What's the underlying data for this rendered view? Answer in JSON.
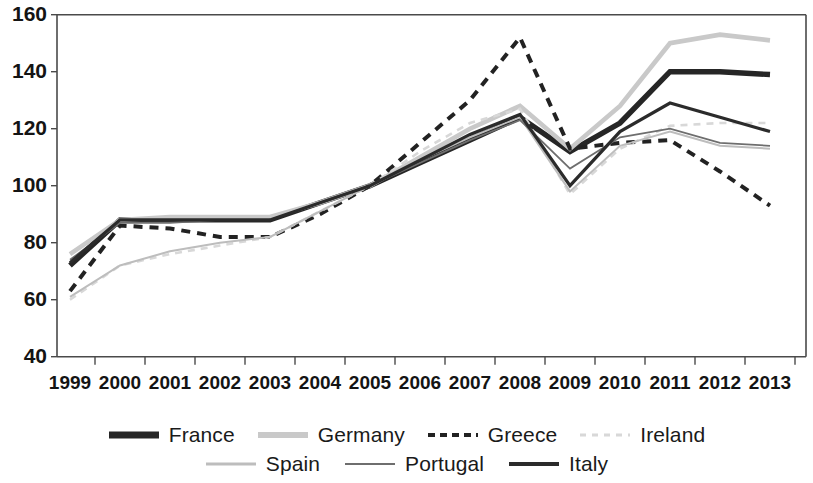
{
  "chart_data": {
    "type": "line",
    "title": "",
    "subtitle": "",
    "xlabel": "",
    "ylabel": "",
    "xlim": [
      1999,
      2013
    ],
    "ylim": [
      40,
      160
    ],
    "yticks": [
      40,
      60,
      80,
      100,
      120,
      140,
      160
    ],
    "grid": false,
    "legend_position": "bottom",
    "x": [
      1999,
      2000,
      2001,
      2002,
      2003,
      2004,
      2005,
      2006,
      2007,
      2008,
      2009,
      2010,
      2011,
      2012,
      2013
    ],
    "categories": [
      "1999",
      "2000",
      "2001",
      "2002",
      "2003",
      "2004",
      "2005",
      "2006",
      "2007",
      "2008",
      "2009",
      "2010",
      "2011",
      "2012",
      "2013"
    ],
    "series": [
      {
        "name": "France",
        "color": "#262626",
        "width": 5.4,
        "dash": "none",
        "values": [
          72,
          88,
          88,
          88,
          88,
          94,
          100,
          108,
          116,
          124,
          112,
          122,
          140,
          140,
          139
        ]
      },
      {
        "name": "Germany",
        "color": "#c9c9c9",
        "width": 4.6,
        "dash": "none",
        "values": [
          76,
          88,
          89,
          89,
          89,
          94,
          100,
          110,
          120,
          128,
          113,
          128,
          150,
          153,
          151
        ]
      },
      {
        "name": "Greece",
        "color": "#222222",
        "width": 4.0,
        "dash": "9,7",
        "values": [
          63,
          86,
          85,
          82,
          82,
          90,
          100,
          115,
          130,
          152,
          113,
          115,
          116,
          105,
          93
        ]
      },
      {
        "name": "Ireland",
        "color": "#d8d8d8",
        "width": 2.6,
        "dash": "7,6",
        "values": [
          60,
          72,
          76,
          79,
          82,
          91,
          100,
          112,
          122,
          127,
          97,
          113,
          121,
          122,
          122
        ]
      },
      {
        "name": "Spain",
        "color": "#bdbdbd",
        "width": 2.0,
        "dash": "none",
        "values": [
          61,
          72,
          77,
          80,
          82,
          91,
          100,
          109,
          117,
          124,
          98,
          114,
          119,
          114,
          113
        ]
      },
      {
        "name": "Portugal",
        "color": "#6e6e6e",
        "width": 1.8,
        "dash": "none",
        "values": [
          74,
          87,
          87,
          88,
          88,
          94,
          100,
          108,
          116,
          123,
          106,
          117,
          120,
          115,
          114
        ]
      },
      {
        "name": "Italy",
        "color": "#2b2b2b",
        "width": 3.2,
        "dash": "none",
        "values": [
          73,
          88,
          88,
          88,
          88,
          94,
          100,
          109,
          118,
          125,
          100,
          119,
          129,
          124,
          119
        ]
      }
    ]
  },
  "axis": {
    "y_tick_labels": [
      "160",
      "140",
      "120",
      "100",
      "80",
      "60",
      "40"
    ],
    "x_tick_labels": [
      "1999",
      "2000",
      "2001",
      "2002",
      "2003",
      "2004",
      "2005",
      "2006",
      "2007",
      "2008",
      "2009",
      "2010",
      "2011",
      "2012",
      "2013"
    ]
  },
  "legend": {
    "row1": [
      {
        "label": "France",
        "color": "#262626",
        "width": 7,
        "dash": "none"
      },
      {
        "label": "Germany",
        "color": "#c9c9c9",
        "width": 6,
        "dash": "none"
      },
      {
        "label": "Greece",
        "color": "#222222",
        "width": 4,
        "dash": "7,5"
      },
      {
        "label": "Ireland",
        "color": "#d8d8d8",
        "width": 3,
        "dash": "6,6"
      }
    ],
    "row2": [
      {
        "label": "Spain",
        "color": "#bdbdbd",
        "width": 3,
        "dash": "none"
      },
      {
        "label": "Portugal",
        "color": "#6e6e6e",
        "width": 2,
        "dash": "none"
      },
      {
        "label": "Italy",
        "color": "#2b2b2b",
        "width": 4,
        "dash": "none"
      }
    ]
  }
}
